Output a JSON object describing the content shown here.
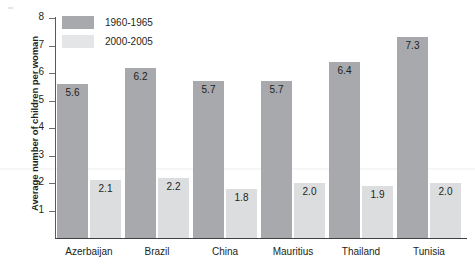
{
  "chart_data": {
    "type": "bar",
    "title": "",
    "xlabel": "",
    "ylabel": "Average number of children per woman",
    "ylim": [
      0,
      8
    ],
    "yticks": [
      8,
      7,
      6,
      5,
      4,
      3,
      2,
      1
    ],
    "grid": false,
    "legend_position": "top-left",
    "categories": [
      "Azerbaijan",
      "Brazil",
      "China",
      "Mauritius",
      "Thailand",
      "Tunisia"
    ],
    "series": [
      {
        "name": "1960-1965",
        "color": "#a7a9ac",
        "values": [
          5.6,
          6.2,
          5.7,
          5.7,
          6.4,
          7.3
        ],
        "labels": [
          "5.6",
          "6.2",
          "5.7",
          "5.7",
          "6.4",
          "7.3"
        ]
      },
      {
        "name": "2000-2005",
        "color": "#dcdddf",
        "values": [
          2.1,
          2.2,
          1.8,
          2.0,
          1.9,
          2.0
        ],
        "labels": [
          "2.1",
          "2.2",
          "1.8",
          "2.0",
          "1.9",
          "2.0"
        ]
      }
    ]
  },
  "axis": {
    "y_title": "Average number of children per woman",
    "tick_labels": [
      "8",
      "7",
      "6",
      "5",
      "4",
      "3",
      "2",
      "1"
    ]
  },
  "legend": {
    "items": [
      {
        "label": "1960-1965",
        "swatch": "dark-swatch-icon"
      },
      {
        "label": "2000-2005",
        "swatch": "light-swatch-icon"
      }
    ]
  }
}
